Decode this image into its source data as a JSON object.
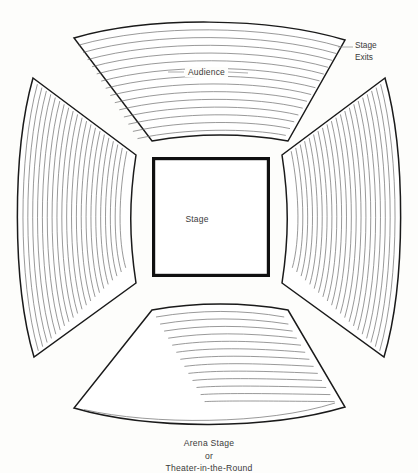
{
  "diagram": {
    "title": "Arena Stage or Theater-in-the-Round",
    "caption_lines": [
      "Arena Stage",
      "or",
      "Theater-in-the-Round"
    ],
    "labels": {
      "audience": "Audience",
      "stage": "Stage",
      "exits_line1": "Stage",
      "exits_line2": "Exits"
    },
    "colors": {
      "background": "#fdfdfb",
      "outline": "#1a1a1a",
      "seat_row": "#6d6d6d",
      "stage_border": "#101010",
      "text": "#3a3a3a"
    },
    "sections": [
      {
        "name": "top-seating-block",
        "rows": 15,
        "orientation": "horizontal-curved"
      },
      {
        "name": "bottom-seating-block",
        "rows": 15,
        "orientation": "horizontal-curved"
      },
      {
        "name": "left-seating-block",
        "rows": 22,
        "orientation": "vertical-curved"
      },
      {
        "name": "right-seating-block",
        "rows": 22,
        "orientation": "vertical-curved"
      }
    ],
    "stage": {
      "shape": "square",
      "x": 152,
      "y": 157,
      "width": 118,
      "height": 120
    }
  }
}
